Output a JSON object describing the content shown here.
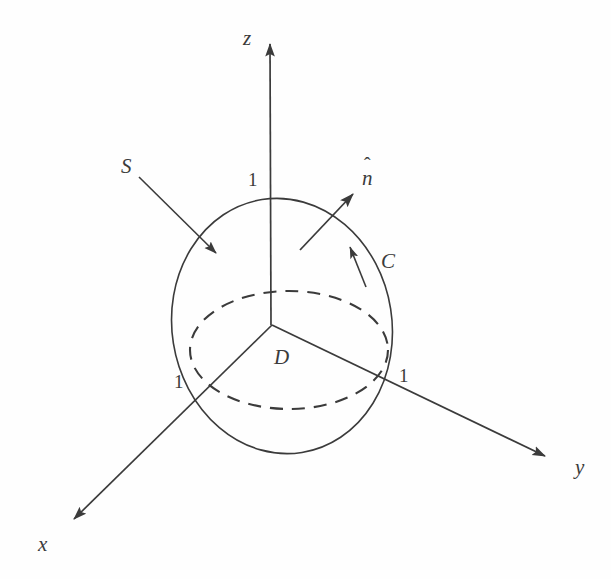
{
  "figure": {
    "background_color": "#fefefe",
    "stroke_color": "#3b3b3b",
    "axes": [
      {
        "name": "z-axis",
        "label": "z",
        "label_x": 243,
        "label_y": 28
      },
      {
        "name": "y-axis",
        "label": "y",
        "label_x": 575,
        "label_y": 457
      },
      {
        "name": "x-axis",
        "label": "x",
        "label_x": 38,
        "label_y": 534
      }
    ],
    "tick_labels": [
      {
        "name": "z-tick-one",
        "text": "1",
        "x": 248,
        "y": 170
      },
      {
        "name": "x-tick-one",
        "text": "1",
        "x": 174,
        "y": 372
      },
      {
        "name": "y-tick-one",
        "text": "1",
        "x": 399,
        "y": 366
      }
    ],
    "annotations": [
      {
        "name": "surface-label",
        "text": "S",
        "x": 121,
        "y": 156
      },
      {
        "name": "region-label",
        "text": "D",
        "x": 274,
        "y": 347
      },
      {
        "name": "curve-label",
        "text": "C",
        "x": 381,
        "y": 251
      },
      {
        "name": "normal-label",
        "base": "n",
        "accent": "̂",
        "x": 362,
        "y": 168
      }
    ],
    "geometry": {
      "origin": {
        "x": 272,
        "y": 325
      },
      "surface_ellipse": {
        "cx": 282,
        "cy": 326,
        "rx": 110,
        "ry": 128,
        "rotation_deg": -9,
        "style": "solid"
      },
      "disk_ellipse": {
        "cx": 289,
        "cy": 350,
        "rx": 99,
        "ry": 59,
        "style": "dashed"
      },
      "z_axis_tip": {
        "x": 270,
        "y": 36
      },
      "x_axis_tip": {
        "x": 66,
        "y": 528
      },
      "y_axis_tip": {
        "x": 553,
        "y": 462
      },
      "normal_arrow": {
        "x1": 300,
        "y1": 250,
        "x2": 356,
        "y2": 191
      },
      "curve_arrow": {
        "x1": 366,
        "y1": 287,
        "x2": 349,
        "y2": 243
      },
      "surface_pointer": {
        "x1": 139,
        "y1": 177,
        "x2": 219,
        "y2": 256
      }
    }
  }
}
